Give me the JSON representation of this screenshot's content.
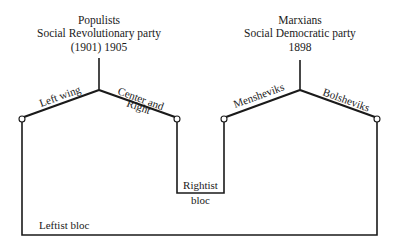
{
  "diagram": {
    "left_party": {
      "group": "Populists",
      "name": "Social Revolutionary party",
      "years": "(1901) 1905",
      "branches": {
        "left": "Left wing",
        "right_line1": "Center and",
        "right_line2": "Right"
      }
    },
    "right_party": {
      "group": "Marxians",
      "name": "Social Democratic party",
      "years": "1898",
      "branches": {
        "left": "Mensheviks",
        "right": "Bolsheviks"
      }
    },
    "blocs": {
      "rightist_line1": "Rightist",
      "rightist_line2": "bloc",
      "leftist": "Leftist bloc"
    }
  }
}
